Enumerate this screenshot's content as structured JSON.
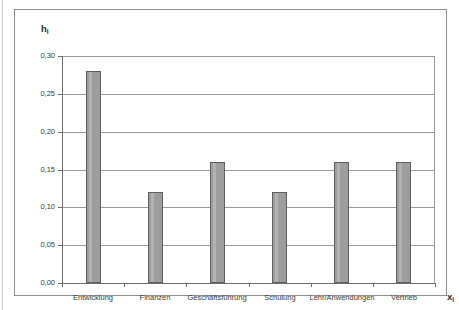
{
  "figure": {
    "y_axis_caption": "h",
    "y_axis_caption_sub": "i",
    "x_axis_caption": "x",
    "x_axis_caption_sub": "i"
  },
  "chart_data": {
    "type": "bar",
    "title": "",
    "subtitle": "",
    "xlabel": "xi",
    "ylabel": "hi",
    "categories": [
      "Entwicklung",
      "Finanzen",
      "Geschäftsführung",
      "Schulung",
      "Lehr/Anwendungen",
      "Vertrieb"
    ],
    "values": [
      0.28,
      0.12,
      0.16,
      0.12,
      0.16,
      0.16
    ],
    "ylim": [
      0.0,
      0.3
    ],
    "ytick_values": [
      0.0,
      0.05,
      0.1,
      0.15,
      0.2,
      0.25,
      0.3
    ],
    "ytick_labels": [
      "0,00",
      "0,05",
      "0,10",
      "0,15",
      "0,20",
      "0,25",
      "0,30"
    ],
    "grid": true,
    "grid_axis": "y",
    "legend": false,
    "legend_position": "none",
    "bar_color": "#9d9d9d",
    "bar_edge_color": "#5f5f5f",
    "grid_color": "#9a9a9a",
    "axis_color": "#6d6d6d",
    "background_color": "#ffffff",
    "frame_color": "#8d8d8d"
  }
}
